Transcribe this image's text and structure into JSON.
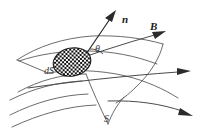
{
  "figure": {
    "background_color": "#ffffff",
    "width": 208,
    "height": 136
  },
  "labels": {
    "normal_vector": "n",
    "field_vector": "B",
    "angle": "θ",
    "area_element": "dS",
    "surface": "S"
  },
  "colors": {
    "ink": "#1a1a1a",
    "surface_stroke": "#5a5a5a",
    "field_stroke": "#4a4a4a",
    "vector_stroke": "#2b2b2b"
  },
  "elements": {
    "normal_arrow_name": "normal-vector-arrow",
    "field_arrow_name": "magnetic-field-arrow",
    "patch_name": "area-element-patch",
    "surface_name": "curved-surface",
    "field_line_count": 3
  }
}
